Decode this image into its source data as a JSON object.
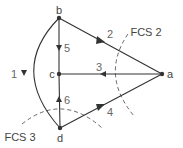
{
  "nodes": [
    {
      "id": "a",
      "label": "a",
      "x": 162,
      "y": 74
    },
    {
      "id": "b",
      "label": "b",
      "x": 59,
      "y": 18
    },
    {
      "id": "c",
      "label": "c",
      "x": 59,
      "y": 74
    },
    {
      "id": "d",
      "label": "d",
      "x": 60,
      "y": 128
    }
  ],
  "edges": [
    {
      "id": "1",
      "label": "1",
      "from": "b",
      "to": "d",
      "shape": "arc"
    },
    {
      "id": "2",
      "label": "2",
      "from": "b",
      "to": "a"
    },
    {
      "id": "3",
      "label": "3",
      "from": "a",
      "to": "c"
    },
    {
      "id": "4",
      "label": "4",
      "from": "d",
      "to": "a"
    },
    {
      "id": "5",
      "label": "5",
      "from": "b",
      "to": "c"
    },
    {
      "id": "6",
      "label": "6",
      "from": "d",
      "to": "c"
    }
  ],
  "cutsets": [
    {
      "id": "fcs2",
      "label": "FCS 2",
      "style": "dashed"
    },
    {
      "id": "fcs3",
      "label": "FCS 3",
      "style": "dashed"
    }
  ],
  "colors": {
    "edge": "#333333",
    "node": "#333333",
    "cutset": "#555555",
    "text": "#444444"
  }
}
